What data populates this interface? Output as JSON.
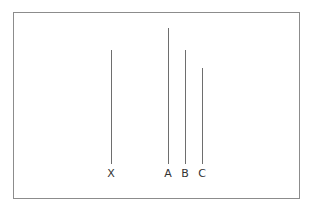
{
  "diagram": {
    "frame_color": "#8c8c8c",
    "line_color": "#6e6e6e",
    "lines": [
      {
        "label": "X",
        "x": 111,
        "top": 50,
        "bottom": 164
      },
      {
        "label": "A",
        "x": 168,
        "top": 28,
        "bottom": 164
      },
      {
        "label": "B",
        "x": 185,
        "top": 50,
        "bottom": 164
      },
      {
        "label": "C",
        "x": 202,
        "top": 68,
        "bottom": 164
      }
    ],
    "label_y": 168
  }
}
